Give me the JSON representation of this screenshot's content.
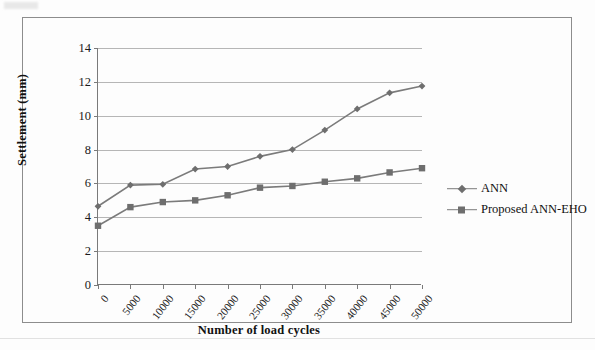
{
  "figure": {
    "has_border": true,
    "background": "#fdfdfd"
  },
  "legend": {
    "position": "right",
    "entries": [
      {
        "label": "ANN",
        "marker": "diamond",
        "color": "#6e6e6e"
      },
      {
        "label": "Proposed ANN-EHO",
        "marker": "square",
        "color": "#6e6e6e"
      }
    ]
  },
  "chart_data": {
    "type": "line",
    "title": "",
    "xlabel": "Number of load cycles",
    "ylabel": "Settlement (mm)",
    "x": [
      0,
      5000,
      10000,
      15000,
      20000,
      25000,
      30000,
      35000,
      40000,
      45000,
      50000
    ],
    "xtick_labels": [
      "0",
      "5000",
      "10000",
      "15000",
      "20000",
      "25000",
      "30000",
      "35000",
      "40000",
      "45000",
      "50000"
    ],
    "ytick_labels": [
      "0",
      "2",
      "4",
      "6",
      "8",
      "10",
      "12",
      "14"
    ],
    "yticks": [
      0,
      2,
      4,
      6,
      8,
      10,
      12,
      14
    ],
    "ylim": [
      0,
      14
    ],
    "xlim": [
      0,
      50000
    ],
    "grid": "horizontal",
    "line_color": "#7b7b7b",
    "series": [
      {
        "name": "ANN",
        "marker": "diamond",
        "color": "#6e6e6e",
        "values": [
          4.65,
          5.9,
          5.95,
          6.85,
          7.0,
          7.6,
          8.0,
          9.15,
          10.4,
          11.35,
          11.75
        ]
      },
      {
        "name": "Proposed ANN-EHO",
        "marker": "square",
        "color": "#6e6e6e",
        "values": [
          3.5,
          4.6,
          4.9,
          5.0,
          5.3,
          5.75,
          5.85,
          6.1,
          6.3,
          6.65,
          6.9
        ]
      }
    ]
  }
}
